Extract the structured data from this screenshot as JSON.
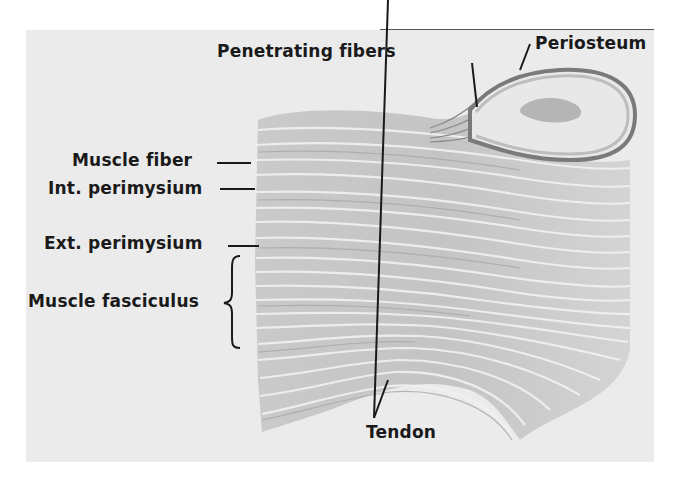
{
  "figure": {
    "background_color": "#ebebeb",
    "labels": {
      "penetrating_fibers": "Penetrating fibers",
      "periosteum": "Periosteum",
      "muscle_fiber": "Muscle fiber",
      "int_perimysium": "Int. perimysium",
      "ext_perimysium": "Ext. perimysium",
      "muscle_fasciculus": "Muscle fasciculus",
      "tendon": "Tendon"
    }
  }
}
